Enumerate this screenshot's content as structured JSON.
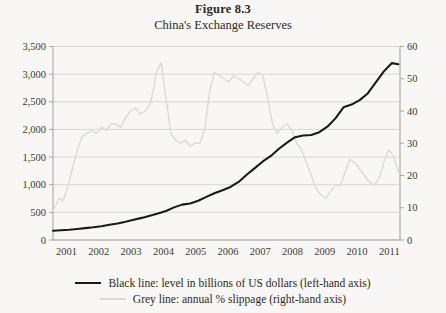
{
  "figure": {
    "number": "Figure 8.3",
    "subtitle": "China's Exchange Reserves"
  },
  "legend": {
    "black_label": "Black line: level in billions of US dollars (left-hand axis)",
    "grey_label": "Grey line: annual % slippage (right-hand axis)",
    "black_color": "#1b1a18",
    "grey_color": "#dedcd8"
  },
  "axes": {
    "left_ticks": [
      "3,500",
      "3,000",
      "2,500",
      "2,000",
      "1,500",
      "1,000",
      "500",
      "0"
    ],
    "right_ticks": [
      "60",
      "50",
      "40",
      "30",
      "20",
      "10",
      "0"
    ],
    "x_ticks": [
      "2001",
      "2002",
      "2003",
      "2004",
      "2005",
      "2006",
      "2007",
      "2008",
      "2009",
      "2010",
      "2011"
    ]
  },
  "chart_data": {
    "type": "line",
    "title": "Figure 8.3",
    "subtitle": "China's Exchange Reserves",
    "xlabel": "",
    "ylabel": "Billions of US dollars",
    "y2label": "Annual % slippage",
    "xlim": [
      2001.0,
      2011.75
    ],
    "ylim": [
      0,
      3500
    ],
    "y2lim": [
      0,
      60
    ],
    "grid": true,
    "legend_position": "below",
    "series": [
      {
        "name": "Black line: level in billions of US dollars (left-hand axis)",
        "axis": "left",
        "color": "#1b1a18",
        "units": "billions of US dollars",
        "x": [
          2001.0,
          2001.25,
          2001.5,
          2001.75,
          2002.0,
          2002.25,
          2002.5,
          2002.75,
          2003.0,
          2003.25,
          2003.5,
          2003.75,
          2004.0,
          2004.25,
          2004.5,
          2004.75,
          2005.0,
          2005.25,
          2005.5,
          2005.75,
          2006.0,
          2006.25,
          2006.5,
          2006.75,
          2007.0,
          2007.25,
          2007.5,
          2007.75,
          2008.0,
          2008.25,
          2008.5,
          2008.75,
          2009.0,
          2009.25,
          2009.5,
          2009.75,
          2010.0,
          2010.25,
          2010.5,
          2010.75,
          2011.0,
          2011.25,
          2011.5,
          2011.7
        ],
        "values": [
          168,
          175,
          185,
          200,
          215,
          230,
          250,
          275,
          300,
          330,
          365,
          400,
          440,
          480,
          525,
          590,
          640,
          660,
          710,
          780,
          845,
          900,
          960,
          1050,
          1180,
          1300,
          1420,
          1520,
          1650,
          1760,
          1860,
          1890,
          1900,
          1950,
          2050,
          2200,
          2400,
          2450,
          2530,
          2650,
          2850,
          3050,
          3200,
          3180
        ]
      },
      {
        "name": "Grey line: annual % slippage (right-hand axis)",
        "axis": "right",
        "color": "#dedcd8",
        "units": "percent",
        "x": [
          2001.0,
          2001.1,
          2001.2,
          2001.3,
          2001.45,
          2001.6,
          2001.75,
          2001.9,
          2002.05,
          2002.2,
          2002.35,
          2002.5,
          2002.65,
          2002.8,
          2002.95,
          2003.1,
          2003.25,
          2003.4,
          2003.55,
          2003.7,
          2003.85,
          2004.0,
          2004.1,
          2004.2,
          2004.35,
          2004.5,
          2004.65,
          2004.8,
          2004.95,
          2005.1,
          2005.25,
          2005.4,
          2005.55,
          2005.7,
          2005.85,
          2006.0,
          2006.15,
          2006.3,
          2006.45,
          2006.6,
          2006.75,
          2006.9,
          2007.05,
          2007.2,
          2007.35,
          2007.5,
          2007.65,
          2007.8,
          2007.95,
          2008.1,
          2008.25,
          2008.4,
          2008.55,
          2008.7,
          2008.85,
          2009.0,
          2009.15,
          2009.3,
          2009.45,
          2009.6,
          2009.75,
          2009.9,
          2010.05,
          2010.2,
          2010.35,
          2010.5,
          2010.65,
          2010.8,
          2010.95,
          2011.1,
          2011.25,
          2011.4,
          2011.55,
          2011.7
        ],
        "values": [
          9,
          11,
          13,
          12,
          16,
          22,
          28,
          32,
          33,
          34,
          33,
          35,
          34,
          36,
          36,
          35,
          38,
          40,
          41,
          39,
          40,
          42,
          46,
          52,
          55,
          44,
          33,
          31,
          30,
          31,
          29,
          30,
          30,
          34,
          46,
          52,
          51,
          50,
          49,
          51,
          50,
          49,
          48,
          50,
          52,
          51,
          44,
          36,
          33,
          35,
          36,
          34,
          30,
          28,
          24,
          20,
          16,
          14,
          13,
          15,
          17,
          17,
          21,
          25,
          24,
          22,
          20,
          18,
          17,
          19,
          24,
          28,
          26,
          21
        ]
      }
    ]
  }
}
